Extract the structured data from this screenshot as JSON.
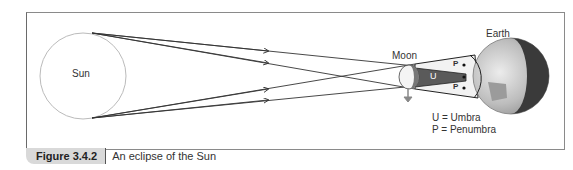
{
  "labels": {
    "sun": "Sun",
    "moon": "Moon",
    "earth": "Earth",
    "umbra_marker": "U",
    "penumbra_marker_top": "P",
    "penumbra_marker_bottom": "P",
    "legend_umbra": "U = Umbra",
    "legend_penumbra": "P = Penumbra"
  },
  "caption": {
    "figure_number": "Figure 3.4.2",
    "title": "An eclipse of the Sun"
  },
  "colors": {
    "frame": "#8a8a8a",
    "umbra": "#555555",
    "penumbra": "#f2f2f2",
    "earth_night": "#3a3a3a",
    "earth_day": "#c8c8c8",
    "caption_tab": "#d9d9d9"
  }
}
